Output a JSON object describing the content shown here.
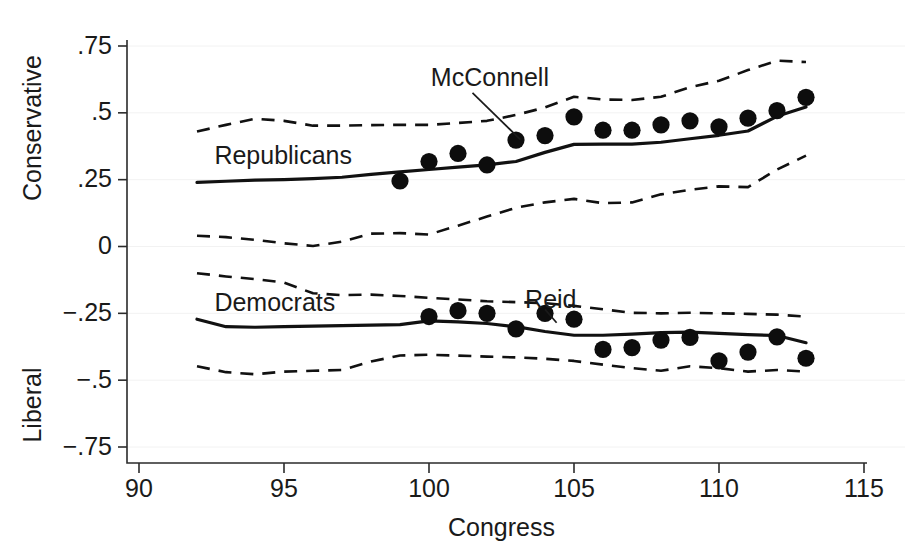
{
  "chart_data": {
    "type": "line",
    "title": "",
    "xlabel": "Congress",
    "ylabel": "",
    "xlim": [
      90,
      115
    ],
    "ylim": [
      -0.75,
      0.75
    ],
    "grid": true,
    "legend_position": "inline-annotations",
    "x_ticks": [
      90,
      95,
      100,
      105,
      110,
      115
    ],
    "x_tick_labels": [
      "90",
      "95",
      "100",
      "105",
      "110",
      "115"
    ],
    "y_ticks": [
      0.75,
      0.5,
      0.25,
      0,
      -0.25,
      -0.5,
      -0.75
    ],
    "y_tick_labels": [
      ".75",
      ".5",
      ".25",
      "0",
      "−.25",
      "−.5",
      "−.75"
    ],
    "y_axis_anchor_top": "Conservative",
    "y_axis_anchor_bottom": "Liberal",
    "annotations": [
      {
        "text": "Republicans",
        "x": 92.6,
        "y": 0.335,
        "align": "left"
      },
      {
        "text": "Democrats",
        "x": 92.6,
        "y": -0.215,
        "align": "left"
      },
      {
        "text": "McConnell",
        "x": 102.1,
        "y": 0.625,
        "align": "center",
        "leader_from": [
          101.5,
          0.575
        ],
        "leader_to": [
          103.15,
          0.4
        ]
      },
      {
        "text": "Reid",
        "x": 104.2,
        "y": -0.205,
        "align": "center",
        "leader_from": [
          104.0,
          -0.235
        ],
        "leader_to": [
          104.4,
          -0.285
        ]
      }
    ],
    "series": [
      {
        "name": "Republicans median",
        "style": "solid",
        "x": [
          92,
          93,
          94,
          95,
          96,
          97,
          98,
          99,
          100,
          101,
          102,
          103,
          104,
          105,
          106,
          107,
          108,
          109,
          110,
          111,
          112,
          113
        ],
        "values": [
          0.24,
          0.244,
          0.248,
          0.25,
          0.254,
          0.259,
          0.27,
          0.279,
          0.288,
          0.297,
          0.305,
          0.318,
          0.352,
          0.382,
          0.383,
          0.383,
          0.39,
          0.403,
          0.416,
          0.432,
          0.487,
          0.522
        ]
      },
      {
        "name": "Republicans 95% upper",
        "style": "dashed",
        "x": [
          92,
          93,
          94,
          95,
          96,
          97,
          98,
          99,
          100,
          101,
          102,
          103,
          104,
          105,
          106,
          107,
          108,
          109,
          110,
          111,
          112,
          113
        ],
        "values": [
          0.43,
          0.455,
          0.478,
          0.47,
          0.452,
          0.452,
          0.454,
          0.455,
          0.455,
          0.462,
          0.47,
          0.492,
          0.52,
          0.56,
          0.55,
          0.548,
          0.56,
          0.596,
          0.62,
          0.66,
          0.695,
          0.69
        ]
      },
      {
        "name": "Republicans 95% lower",
        "style": "dashed",
        "x": [
          92,
          93,
          94,
          95,
          96,
          97,
          98,
          99,
          100,
          101,
          102,
          103,
          104,
          105,
          106,
          107,
          108,
          109,
          110,
          111,
          112,
          113
        ],
        "values": [
          0.04,
          0.035,
          0.025,
          0.012,
          0.002,
          0.018,
          0.048,
          0.05,
          0.045,
          0.078,
          0.112,
          0.145,
          0.165,
          0.178,
          0.162,
          0.165,
          0.195,
          0.212,
          0.225,
          0.222,
          0.288,
          0.34
        ]
      },
      {
        "name": "Democrats median",
        "style": "solid",
        "x": [
          92,
          93,
          94,
          95,
          96,
          97,
          98,
          99,
          100,
          101,
          102,
          103,
          104,
          105,
          106,
          107,
          108,
          109,
          110,
          111,
          112,
          113
        ],
        "values": [
          -0.272,
          -0.3,
          -0.302,
          -0.3,
          -0.298,
          -0.296,
          -0.294,
          -0.292,
          -0.278,
          -0.282,
          -0.288,
          -0.3,
          -0.318,
          -0.332,
          -0.332,
          -0.328,
          -0.322,
          -0.32,
          -0.325,
          -0.33,
          -0.333,
          -0.36
        ]
      },
      {
        "name": "Democrats 95% upper",
        "style": "dashed",
        "x": [
          92,
          93,
          94,
          95,
          96,
          97,
          98,
          99,
          100,
          101,
          102,
          103,
          104,
          105,
          106,
          107,
          108,
          109,
          110,
          111,
          112,
          113
        ],
        "values": [
          -0.1,
          -0.112,
          -0.122,
          -0.135,
          -0.175,
          -0.182,
          -0.18,
          -0.185,
          -0.192,
          -0.198,
          -0.205,
          -0.208,
          -0.212,
          -0.222,
          -0.235,
          -0.248,
          -0.25,
          -0.248,
          -0.25,
          -0.252,
          -0.255,
          -0.262
        ]
      },
      {
        "name": "Democrats 95% lower",
        "style": "dashed",
        "x": [
          92,
          93,
          94,
          95,
          96,
          97,
          98,
          99,
          100,
          101,
          102,
          103,
          104,
          105,
          106,
          107,
          108,
          109,
          110,
          111,
          112,
          113
        ],
        "values": [
          -0.448,
          -0.47,
          -0.478,
          -0.468,
          -0.465,
          -0.462,
          -0.43,
          -0.408,
          -0.405,
          -0.408,
          -0.412,
          -0.415,
          -0.42,
          -0.428,
          -0.442,
          -0.455,
          -0.465,
          -0.448,
          -0.455,
          -0.468,
          -0.462,
          -0.468
        ]
      }
    ],
    "points": [
      {
        "name": "McConnell",
        "label": "McConnell",
        "x": [
          99,
          100,
          101,
          102,
          103,
          104,
          105,
          106,
          107,
          108,
          109,
          110,
          111,
          112,
          113
        ],
        "values": [
          0.245,
          0.318,
          0.348,
          0.305,
          0.398,
          0.415,
          0.485,
          0.435,
          0.435,
          0.455,
          0.47,
          0.448,
          0.48,
          0.508,
          0.558
        ]
      },
      {
        "name": "Reid",
        "label": "Reid",
        "x": [
          100,
          101,
          102,
          103,
          104,
          105,
          106,
          107,
          108,
          109,
          110,
          111,
          112,
          113
        ],
        "values": [
          -0.262,
          -0.24,
          -0.25,
          -0.308,
          -0.25,
          -0.272,
          -0.385,
          -0.378,
          -0.35,
          -0.34,
          -0.428,
          -0.395,
          -0.338,
          -0.418
        ]
      }
    ]
  }
}
